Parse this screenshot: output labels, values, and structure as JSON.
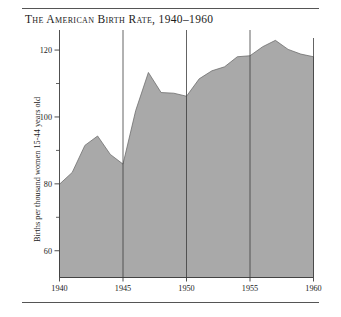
{
  "figure": {
    "title": "The American Birth Rate, 1940–1960",
    "rules": {
      "top": true,
      "bottom": true
    }
  },
  "chart_data": {
    "type": "area",
    "title": "The American Birth Rate, 1940–1960",
    "xlabel": "",
    "ylabel": "Births per thousand women 15-44 years old",
    "xlim": [
      1940,
      1960
    ],
    "ylim": [
      52,
      126
    ],
    "grid": false,
    "vertical_gridlines": [
      1945,
      1950,
      1955
    ],
    "legend": "none",
    "fill_color": "#a9a9a9",
    "line_color": "#6e6e6e",
    "axis_color": "#3c3c3c",
    "x_ticks": [
      1940,
      1945,
      1950,
      1955,
      1960
    ],
    "x_tick_labels": [
      "1940",
      "1945",
      "1950",
      "1955",
      "1960"
    ],
    "y_ticks_major": [
      60,
      80,
      100,
      120
    ],
    "y_tick_labels": [
      "60",
      "80",
      "100",
      "120"
    ],
    "y_ticks_minor": [
      70,
      90,
      110
    ],
    "x": [
      1940,
      1941,
      1942,
      1943,
      1944,
      1945,
      1946,
      1947,
      1948,
      1949,
      1950,
      1951,
      1952,
      1953,
      1954,
      1955,
      1956,
      1957,
      1958,
      1959,
      1960
    ],
    "values": [
      79.9,
      83.4,
      91.5,
      94.3,
      88.8,
      85.9,
      101.9,
      113.3,
      107.3,
      107.1,
      106.2,
      111.4,
      113.8,
      115.0,
      118.0,
      118.3,
      121.0,
      122.9,
      120.2,
      118.8,
      118.0
    ],
    "series": [
      {
        "name": "Births per thousand women 15-44 years old",
        "values": [
          79.9,
          83.4,
          91.5,
          94.3,
          88.8,
          85.9,
          101.9,
          113.3,
          107.3,
          107.1,
          106.2,
          111.4,
          113.8,
          115.0,
          118.0,
          118.3,
          121.0,
          122.9,
          120.2,
          118.8,
          118.0
        ]
      }
    ]
  }
}
